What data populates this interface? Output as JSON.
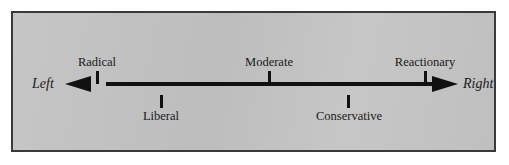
{
  "figure": {
    "type": "political-spectrum-line",
    "background_color": "#c3c3c3",
    "border_color": "#3a3a3a",
    "line_color": "#111111"
  },
  "axis": {
    "left_end_label": "Left",
    "right_end_label": "Right",
    "left_arrow": "arrow-left-icon",
    "right_arrow": "arrow-right-icon"
  },
  "positions": [
    {
      "label": "Radical",
      "side": "above",
      "order": 1
    },
    {
      "label": "Liberal",
      "side": "below",
      "order": 2
    },
    {
      "label": "Moderate",
      "side": "above",
      "order": 3
    },
    {
      "label": "Conservative",
      "side": "below",
      "order": 4
    },
    {
      "label": "Reactionary",
      "side": "above",
      "order": 5
    }
  ]
}
